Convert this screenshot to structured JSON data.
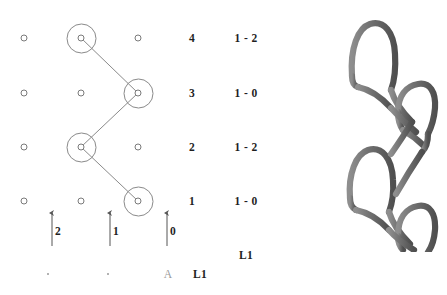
{
  "figure": {
    "title_visible": false,
    "background": "#ffffff",
    "line_color": "#8a8a8a",
    "marker_color": "#7a7a7a",
    "text_color": "#1f1f1f",
    "faint_text_color": "#9a9a9a",
    "yarn_color": "#767676",
    "yarn_edge_color": "#4a4a4a"
  },
  "grid": {
    "columns": [
      {
        "id": "col-2",
        "x": 24
      },
      {
        "id": "col-1",
        "x": 81
      },
      {
        "id": "col-0",
        "x": 138
      }
    ],
    "rows": [
      {
        "id": "row-4",
        "y": 38,
        "label": "4",
        "code": "1 - 2",
        "active_column": "col-1"
      },
      {
        "id": "row-3",
        "y": 93,
        "label": "3",
        "code": "1 - 0",
        "active_column": "col-0"
      },
      {
        "id": "row-2",
        "y": 147,
        "label": "2",
        "code": "1 - 2",
        "active_column": "col-1"
      },
      {
        "id": "row-1",
        "y": 201,
        "label": "1",
        "code": "1 - 0",
        "active_column": "col-0"
      }
    ]
  },
  "path": {
    "description": "zigzag-yarn-path",
    "points": [
      {
        "x": 81,
        "y": 38
      },
      {
        "x": 138,
        "y": 93
      },
      {
        "x": 81,
        "y": 147
      },
      {
        "x": 138,
        "y": 201
      }
    ]
  },
  "row_labels": {
    "column_x": 192,
    "values": [
      "4",
      "3",
      "2",
      "1"
    ]
  },
  "row_codes": {
    "column_x": 246,
    "values": [
      "1 - 2",
      "1 - 0",
      "1 - 2",
      "1 - 0"
    ]
  },
  "arrows": [
    {
      "id": "arrow-2",
      "x": 52,
      "label": "2"
    },
    {
      "id": "arrow-1",
      "x": 110,
      "label": "1"
    },
    {
      "id": "arrow-0",
      "x": 167,
      "label": "0"
    }
  ],
  "legend": {
    "upper_right": {
      "text": "L1",
      "x": 246,
      "y": 255
    },
    "bottom_row": [
      {
        "id": "legend-dot-1",
        "type": "dot",
        "x": 48,
        "y": 274
      },
      {
        "id": "legend-dot-2",
        "type": "dot",
        "x": 108,
        "y": 274
      },
      {
        "id": "legend-a",
        "type": "text",
        "text": "A",
        "x": 168,
        "y": 274,
        "faint": true
      },
      {
        "id": "legend-l1",
        "type": "text",
        "text": "L1",
        "x": 200,
        "y": 274,
        "faint": false
      }
    ]
  },
  "render": {
    "name": "knitted-loop-structure-render",
    "loop_count": 4,
    "description": "3D rendering of interlocked yarn loops"
  }
}
